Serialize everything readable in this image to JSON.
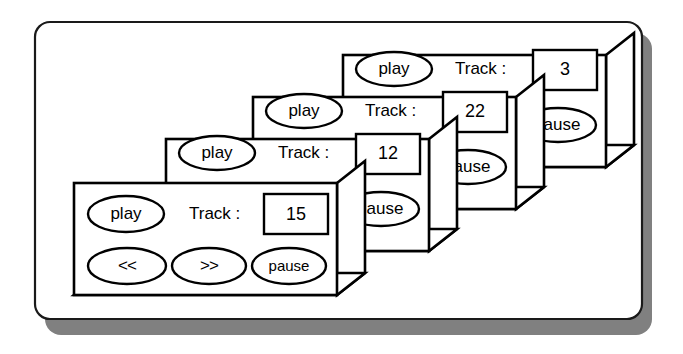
{
  "figure": {
    "type": "stacked-window-diagram",
    "background_color": "#ffffff",
    "outline_color": "#000000",
    "shadow_color": "#808080",
    "panel_fill": "#ffffff"
  },
  "container": {
    "name": "rounded-frame",
    "shadow_offset_px": 10,
    "corner_radius_px": 14
  },
  "labels": {
    "track_label": "Track :",
    "play": "play",
    "pause": "pause",
    "rewind": "<<",
    "forward": ">>",
    "pause_clipped": "ause"
  },
  "panels": [
    {
      "index": 4,
      "name": "player-window-back",
      "track_value": "3",
      "play_label": "play",
      "track_label": "Track :",
      "pause_label": "ause",
      "occluded": true
    },
    {
      "index": 3,
      "name": "player-window-third",
      "track_value": "22",
      "play_label": "play",
      "track_label": "Track :",
      "pause_label": "ause",
      "occluded": true
    },
    {
      "index": 2,
      "name": "player-window-second",
      "track_value": "12",
      "play_label": "play",
      "track_label": "Track :",
      "pause_label": "ause",
      "occluded": true
    },
    {
      "index": 1,
      "name": "player-window-front",
      "track_value": "15",
      "play_label": "play",
      "track_label": "Track :",
      "rewind_label": "<<",
      "forward_label": ">>",
      "pause_label": "pause",
      "occluded": false
    }
  ]
}
